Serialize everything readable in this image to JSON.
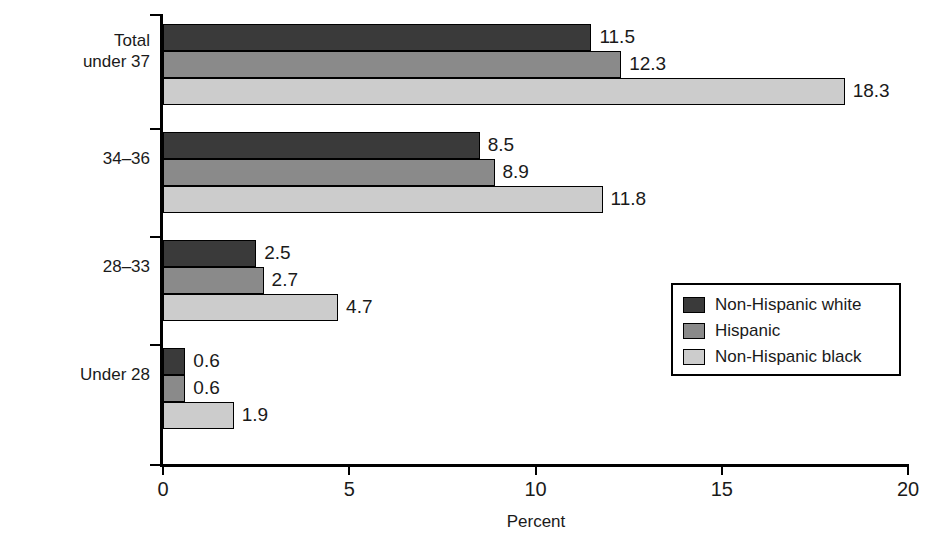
{
  "chart_data": {
    "type": "bar",
    "orientation": "horizontal",
    "title": "",
    "xlabel": "Percent",
    "ylabel": "Weeks of gestation",
    "xlim": [
      0,
      20
    ],
    "xticks": [
      0,
      5,
      10,
      15,
      20
    ],
    "xtick_labels": [
      "0",
      "5",
      "10",
      "15",
      "20"
    ],
    "grid": false,
    "legend_position": "middle-right",
    "categories": [
      "Total under 37",
      "34–36",
      "28–33",
      "Under 28"
    ],
    "category_label_lines": [
      [
        "Total",
        "under 37"
      ],
      [
        "34–36"
      ],
      [
        "28–33"
      ],
      [
        "Under 28"
      ]
    ],
    "series": [
      {
        "name": "Non-Hispanic white",
        "color": "#3a3a3a",
        "values": [
          11.5,
          8.5,
          2.5,
          0.6
        ],
        "value_labels": [
          "11.5",
          "8.5",
          "2.5",
          "0.6"
        ]
      },
      {
        "name": "Hispanic",
        "color": "#8a8a8a",
        "values": [
          12.3,
          8.9,
          2.7,
          0.6
        ],
        "value_labels": [
          "12.3",
          "8.9",
          "2.7",
          "0.6"
        ]
      },
      {
        "name": "Non-Hispanic black",
        "color": "#cccccc",
        "values": [
          18.3,
          11.8,
          4.7,
          1.9
        ],
        "value_labels": [
          "18.3",
          "11.8",
          "4.7",
          "1.9"
        ]
      }
    ]
  },
  "legend": {
    "items": [
      {
        "label": "Non-Hispanic white",
        "color": "#3a3a3a"
      },
      {
        "label": "Hispanic",
        "color": "#8a8a8a"
      },
      {
        "label": "Non-Hispanic black",
        "color": "#cccccc"
      }
    ]
  },
  "axes": {
    "x_title": "Percent",
    "y_title": "Weeks of gestation",
    "x_tick_labels": [
      "0",
      "5",
      "10",
      "15",
      "20"
    ]
  }
}
